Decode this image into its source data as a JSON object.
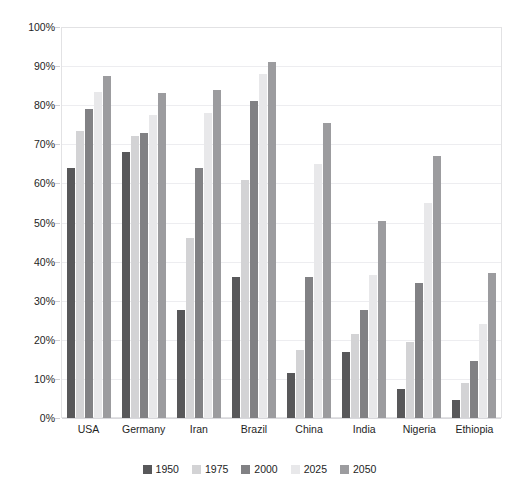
{
  "chart_data": {
    "type": "bar",
    "title": "",
    "xlabel": "",
    "ylabel": "",
    "ylim": [
      0,
      100
    ],
    "ytick_labels": [
      "100%",
      "90%",
      "80%",
      "70%",
      "60%",
      "50%",
      "40%",
      "30%",
      "20%",
      "10%",
      "0%"
    ],
    "ytick_values": [
      100,
      90,
      80,
      70,
      60,
      50,
      40,
      30,
      20,
      10,
      0
    ],
    "grid": true,
    "legend_position": "bottom",
    "categories": [
      "USA",
      "Germany",
      "Iran",
      "Brazil",
      "China",
      "India",
      "Nigeria",
      "Ethiopia"
    ],
    "series": [
      {
        "name": "1950",
        "color": "#58585a",
        "values": [
          64,
          68,
          27.5,
          36,
          11.5,
          17,
          7.5,
          4.5
        ]
      },
      {
        "name": "1975",
        "color": "#d3d3d5",
        "values": [
          73.5,
          72,
          46,
          61,
          17.5,
          21.5,
          19.5,
          9
        ]
      },
      {
        "name": "2000",
        "color": "#818184",
        "values": [
          79,
          73,
          64,
          81,
          36,
          27.5,
          34.5,
          14.5
        ]
      },
      {
        "name": "2025",
        "color": "#e8e8ea",
        "values": [
          83.5,
          77.5,
          78,
          88,
          65,
          36.5,
          55,
          24
        ]
      },
      {
        "name": "2050",
        "color": "#9c9c9f",
        "values": [
          87.5,
          83,
          84,
          91,
          75.5,
          50.5,
          67,
          37
        ]
      }
    ]
  },
  "colors": {
    "background": "#ffffff",
    "plot_border": "#e2e2e4",
    "gridline": "#ededf0",
    "axis_text": "#1e1e1e"
  }
}
